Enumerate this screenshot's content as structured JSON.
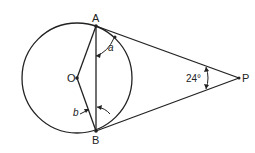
{
  "diagram": {
    "type": "geometry",
    "points": {
      "A": {
        "label": "A",
        "x": 96,
        "y": 26
      },
      "B": {
        "label": "B",
        "x": 96,
        "y": 131
      },
      "O": {
        "label": "O",
        "x": 77,
        "y": 78
      },
      "P": {
        "label": "P",
        "x": 239,
        "y": 78
      }
    },
    "circle": {
      "center": "O",
      "cx": 77,
      "cy": 78,
      "r": 55
    },
    "segments": [
      "PA",
      "PB",
      "AB",
      "OA",
      "OB"
    ],
    "angles": {
      "a": {
        "label": "a",
        "between": "PA and AB"
      },
      "b": {
        "label": "b",
        "between": "OB and AB"
      },
      "P": {
        "label": "24°",
        "value_deg": 24
      }
    },
    "colors": {
      "stroke": "#222222",
      "background": "#ffffff"
    }
  }
}
